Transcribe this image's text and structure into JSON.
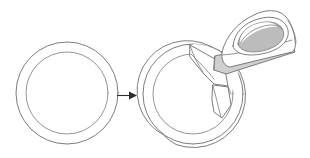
{
  "figure": {
    "title": "Ring seam ironing diagram",
    "type": "line-art illustration",
    "background_color": "#ffffff",
    "line_color": "#6e6e72",
    "shade_color": "#bcbcbc",
    "arrow_color": "#2b2b2b"
  },
  "stages": [
    {
      "id": "before",
      "name": "closed-ring",
      "label": "",
      "description": "Plain closed ring / annulus drawn as two concentric circles"
    },
    {
      "id": "after",
      "name": "ring-with-iron",
      "label": "",
      "description": "Same ring with an opened seam flap, being pressed by a clothes iron"
    }
  ],
  "arrow": {
    "name": "transform-arrow",
    "label": "",
    "direction": "right"
  },
  "objects": {
    "left_ring": {
      "label": "",
      "outer_center_x": 67,
      "outer_center_y": 93,
      "outer_radius_x": 51,
      "outer_radius_y": 51,
      "inner_radius_x": 41,
      "inner_radius_y": 41
    },
    "right_ring": {
      "label": "",
      "outer_center_x": 193,
      "outer_center_y": 94,
      "outer_radius_x": 50,
      "outer_radius_y": 50,
      "inner_radius_x": 40,
      "inner_radius_y": 40
    },
    "iron": {
      "label": "",
      "body_color": "#ffffff",
      "handle_color": "#bcbcbc",
      "soleplate_color": "#c6c6c6"
    }
  }
}
